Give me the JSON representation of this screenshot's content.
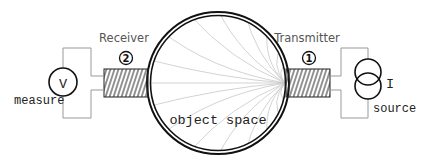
{
  "diagram": {
    "receiver": {
      "label": "Receiver",
      "number": "2"
    },
    "transmitter": {
      "label": "Transmitter",
      "number": "1"
    },
    "object_space": {
      "label": "object space"
    },
    "meter": {
      "symbol": "V",
      "label": "measure"
    },
    "source": {
      "symbol": "I",
      "label": "source"
    },
    "colors": {
      "line": "#111111",
      "wire": "#999999",
      "field": "#c8c8c8",
      "text": "#555555"
    }
  }
}
